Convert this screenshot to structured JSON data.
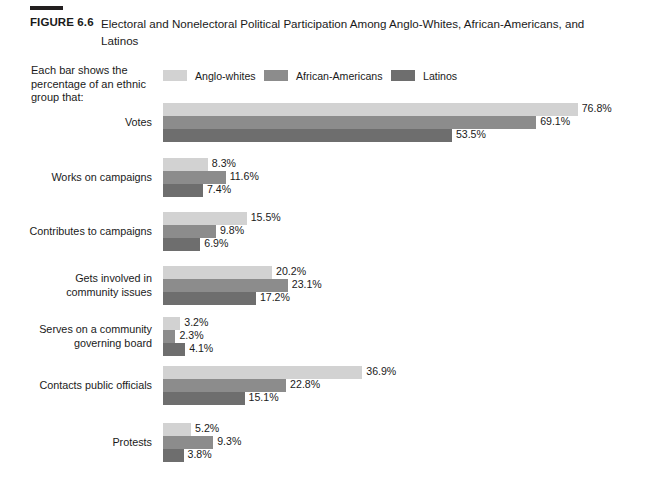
{
  "figure": {
    "number": "FIGURE 6.6",
    "title": "Electoral and Nonelectoral Political Participation Among Anglo-Whites, African-Americans, and Latinos"
  },
  "caption": "Each bar shows the percentage of an ethnic group that:",
  "colors": {
    "anglo_whites": "#d2d2d2",
    "african_americans": "#8c8c8c",
    "latinos": "#6e6e6e",
    "text": "#1a1a1a",
    "background": "#ffffff",
    "rule": "#231f20"
  },
  "legend": {
    "items": [
      {
        "label": "Anglo-whites",
        "color": "#d2d2d2",
        "swatch_name": "legend-swatch-anglo-whites"
      },
      {
        "label": "African-Americans",
        "color": "#8c8c8c",
        "swatch_name": "legend-swatch-african-americans"
      },
      {
        "label": "Latinos",
        "color": "#6e6e6e",
        "swatch_name": "legend-swatch-latinos"
      }
    ]
  },
  "chart_data": {
    "type": "bar",
    "orientation": "horizontal",
    "title": "Electoral and Nonelectoral Political Participation Among Anglo-Whites, African-Americans, and Latinos",
    "subtitle": "Each bar shows the percentage of an ethnic group that:",
    "xlabel": "",
    "ylabel": "",
    "grid": false,
    "legend_position": "top",
    "value_suffix": "%",
    "xlim": [
      0,
      80
    ],
    "categories": [
      "Votes",
      "Works on campaigns",
      "Contributes to campaigns",
      "Gets involved in community issues",
      "Serves on a community governing board",
      "Contacts public officials",
      "Protests"
    ],
    "category_labels_wrapped": [
      [
        "Votes"
      ],
      [
        "Works on campaigns"
      ],
      [
        "Contributes to campaigns"
      ],
      [
        "Gets involved in",
        "community issues"
      ],
      [
        "Serves on a community",
        "governing board"
      ],
      [
        "Contacts public officials"
      ],
      [
        "Protests"
      ]
    ],
    "series": [
      {
        "name": "Anglo-whites",
        "color": "#d2d2d2",
        "values": [
          76.8,
          8.3,
          15.5,
          20.2,
          3.2,
          36.9,
          5.2
        ]
      },
      {
        "name": "African-Americans",
        "color": "#8c8c8c",
        "values": [
          69.1,
          11.6,
          9.8,
          23.1,
          2.3,
          22.8,
          9.3
        ]
      },
      {
        "name": "Latinos",
        "color": "#6e6e6e",
        "values": [
          53.5,
          7.4,
          6.9,
          17.2,
          4.1,
          15.1,
          3.8
        ]
      }
    ],
    "value_labels": [
      [
        "76.8%",
        "69.1%",
        "53.5%"
      ],
      [
        "8.3%",
        "11.6%",
        "7.4%"
      ],
      [
        "15.5%",
        "9.8%",
        "6.9%"
      ],
      [
        "20.2%",
        "23.1%",
        "17.2%"
      ],
      [
        "3.2%",
        "2.3%",
        "4.1%"
      ],
      [
        "36.9%",
        "22.8%",
        "15.1%"
      ],
      [
        "5.2%",
        "9.3%",
        "3.8%"
      ]
    ]
  },
  "layout": {
    "bar_origin_x": 163,
    "px_per_percent": 5.4,
    "bar_height": 13,
    "group_tops": [
      103,
      158,
      212,
      266,
      317,
      366,
      423
    ]
  }
}
